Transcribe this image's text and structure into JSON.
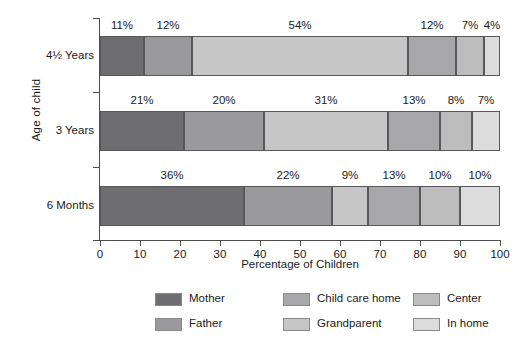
{
  "chart_data": {
    "type": "bar",
    "orientation": "horizontal",
    "stacked": true,
    "stack_total": 100,
    "title": "",
    "xlabel": "Percentage of Children",
    "ylabel": "Age of child",
    "xlim": [
      0,
      100
    ],
    "xticks": [
      "0",
      "10",
      "20",
      "30",
      "40",
      "50",
      "60",
      "70",
      "80",
      "90",
      "100"
    ],
    "grid": false,
    "legend_position": "bottom",
    "categories": [
      "4½ Years",
      "3 Years",
      "6 Months"
    ],
    "series": [
      {
        "name": "Mother",
        "color": "#6e6e70",
        "values": [
          11,
          21,
          36
        ]
      },
      {
        "name": "Father",
        "color": "#9a9a9c",
        "values": [
          12,
          20,
          22
        ]
      },
      {
        "name": "Grandparent",
        "color": "#c6c6c6",
        "values": [
          54,
          31,
          9
        ]
      },
      {
        "name": "Child care home",
        "color": "#a8a8aa",
        "values": [
          12,
          13,
          13
        ]
      },
      {
        "name": "Center",
        "color": "#bdbdbd",
        "values": [
          7,
          8,
          10
        ]
      },
      {
        "name": "In home",
        "color": "#dcdcdc",
        "values": [
          4,
          7,
          10
        ]
      }
    ],
    "bars": [
      {
        "category": "4½ Years",
        "segments": [
          {
            "series": "Mother",
            "value": 11,
            "label": "11%"
          },
          {
            "series": "Father",
            "value": 12,
            "label": "12%"
          },
          {
            "series": "Grandparent",
            "value": 54,
            "label": "54%"
          },
          {
            "series": "Child care home",
            "value": 12,
            "label": "12%"
          },
          {
            "series": "Center",
            "value": 7,
            "label": "7%"
          },
          {
            "series": "In home",
            "value": 4,
            "label": "4%"
          }
        ]
      },
      {
        "category": "3 Years",
        "segments": [
          {
            "series": "Mother",
            "value": 21,
            "label": "21%"
          },
          {
            "series": "Father",
            "value": 20,
            "label": "20%"
          },
          {
            "series": "Grandparent",
            "value": 31,
            "label": "31%"
          },
          {
            "series": "Child care home",
            "value": 13,
            "label": "13%"
          },
          {
            "series": "Center",
            "value": 8,
            "label": "8%"
          },
          {
            "series": "In home",
            "value": 7,
            "label": "7%"
          }
        ]
      },
      {
        "category": "6 Months",
        "segments": [
          {
            "series": "Mother",
            "value": 36,
            "label": "36%"
          },
          {
            "series": "Father",
            "value": 22,
            "label": "22%"
          },
          {
            "series": "Grandparent",
            "value": 9,
            "label": "9%"
          },
          {
            "series": "Child care home",
            "value": 13,
            "label": "13%"
          },
          {
            "series": "Center",
            "value": 10,
            "label": "10%"
          },
          {
            "series": "In home",
            "value": 10,
            "label": "10%"
          }
        ]
      }
    ]
  },
  "legend": {
    "entries": [
      {
        "label": "Mother",
        "color": "#6e6e70"
      },
      {
        "label": "Father",
        "color": "#9a9a9c"
      },
      {
        "label": "Child care home",
        "color": "#a8a8aa"
      },
      {
        "label": "Grandparent",
        "color": "#c6c6c6"
      },
      {
        "label": "Center",
        "color": "#bdbdbd"
      },
      {
        "label": "In home",
        "color": "#dcdcdc"
      }
    ]
  },
  "colors": {
    "axis": "#4d4d4d",
    "segment_border": "#58585a",
    "text": "#1a1a1a",
    "background": "#ffffff"
  }
}
